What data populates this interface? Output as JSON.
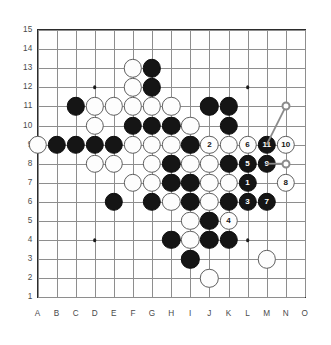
{
  "board": {
    "type": "go-board",
    "size": 15,
    "col_labels": [
      "A",
      "B",
      "C",
      "D",
      "E",
      "F",
      "G",
      "H",
      "I",
      "J",
      "K",
      "L",
      "M",
      "N",
      "O"
    ],
    "row_labels": [
      "15",
      "14",
      "13",
      "12",
      "11",
      "10",
      "9",
      "8",
      "7",
      "6",
      "5",
      "4",
      "3",
      "2",
      "1"
    ],
    "colors": {
      "background": "#ffffff",
      "grid_line": "#8e8e8e",
      "border": "#2b2b2b",
      "black_stone": "#151515",
      "white_stone": "#fdfdfd",
      "white_stone_edge": "#5f5f5f",
      "label": "#4a4a4a",
      "marker": "#8b8b8b"
    },
    "geometry": {
      "origin_x": 37.5,
      "origin_y": 30.0,
      "step": 19.1,
      "stone_diameter": 18.4
    },
    "hoshi": [
      {
        "col": "D",
        "row": 12
      },
      {
        "col": "L",
        "row": 12
      },
      {
        "col": "D",
        "row": 4
      },
      {
        "col": "L",
        "row": 4
      }
    ],
    "black_stones": [
      {
        "col": "G",
        "row": 13
      },
      {
        "col": "G",
        "row": 12
      },
      {
        "col": "C",
        "row": 11
      },
      {
        "col": "J",
        "row": 11
      },
      {
        "col": "K",
        "row": 11
      },
      {
        "col": "F",
        "row": 10
      },
      {
        "col": "G",
        "row": 10
      },
      {
        "col": "H",
        "row": 10
      },
      {
        "col": "K",
        "row": 10
      },
      {
        "col": "B",
        "row": 9
      },
      {
        "col": "C",
        "row": 9
      },
      {
        "col": "D",
        "row": 9
      },
      {
        "col": "E",
        "row": 9
      },
      {
        "col": "I",
        "row": 9
      },
      {
        "col": "H",
        "row": 8
      },
      {
        "col": "K",
        "row": 8
      },
      {
        "col": "H",
        "row": 7
      },
      {
        "col": "I",
        "row": 7
      },
      {
        "col": "E",
        "row": 6
      },
      {
        "col": "G",
        "row": 6
      },
      {
        "col": "I",
        "row": 6
      },
      {
        "col": "K",
        "row": 6
      },
      {
        "col": "J",
        "row": 5
      },
      {
        "col": "H",
        "row": 4
      },
      {
        "col": "J",
        "row": 4
      },
      {
        "col": "K",
        "row": 4
      },
      {
        "col": "I",
        "row": 3
      }
    ],
    "white_stones": [
      {
        "col": "F",
        "row": 13
      },
      {
        "col": "F",
        "row": 12
      },
      {
        "col": "D",
        "row": 11
      },
      {
        "col": "E",
        "row": 11
      },
      {
        "col": "F",
        "row": 11
      },
      {
        "col": "G",
        "row": 11
      },
      {
        "col": "H",
        "row": 11
      },
      {
        "col": "D",
        "row": 10
      },
      {
        "col": "I",
        "row": 10
      },
      {
        "col": "A",
        "row": 9
      },
      {
        "col": "F",
        "row": 9
      },
      {
        "col": "G",
        "row": 9
      },
      {
        "col": "H",
        "row": 9
      },
      {
        "col": "K",
        "row": 9
      },
      {
        "col": "D",
        "row": 8
      },
      {
        "col": "E",
        "row": 8
      },
      {
        "col": "G",
        "row": 8
      },
      {
        "col": "I",
        "row": 8
      },
      {
        "col": "J",
        "row": 8
      },
      {
        "col": "F",
        "row": 7
      },
      {
        "col": "G",
        "row": 7
      },
      {
        "col": "J",
        "row": 7
      },
      {
        "col": "K",
        "row": 7
      },
      {
        "col": "H",
        "row": 6
      },
      {
        "col": "J",
        "row": 6
      },
      {
        "col": "I",
        "row": 5
      },
      {
        "col": "I",
        "row": 4
      },
      {
        "col": "M",
        "row": 3
      },
      {
        "col": "J",
        "row": 2
      }
    ],
    "numbered_moves": [
      {
        "n": "1",
        "col": "L",
        "row": 7,
        "color": "black"
      },
      {
        "n": "2",
        "col": "J",
        "row": 9,
        "color": "white"
      },
      {
        "n": "3",
        "col": "L",
        "row": 6,
        "color": "black"
      },
      {
        "n": "4",
        "col": "K",
        "row": 5,
        "color": "white"
      },
      {
        "n": "5",
        "col": "L",
        "row": 8,
        "color": "black"
      },
      {
        "n": "6",
        "col": "L",
        "row": 9,
        "color": "white"
      },
      {
        "n": "7",
        "col": "M",
        "row": 6,
        "color": "black"
      },
      {
        "n": "8",
        "col": "N",
        "row": 7,
        "color": "white"
      },
      {
        "n": "9",
        "col": "M",
        "row": 8,
        "color": "black"
      },
      {
        "n": "10",
        "col": "N",
        "row": 9,
        "color": "white"
      },
      {
        "n": "11",
        "col": "M",
        "row": 9,
        "color": "black"
      }
    ],
    "markers": [
      {
        "id": "marker-a",
        "col": "N",
        "row": 11,
        "shape": "circle"
      },
      {
        "id": "marker-b",
        "col": "N",
        "row": 8,
        "shape": "circle"
      }
    ],
    "connectors": [
      {
        "from": {
          "col": "N",
          "row": 11
        },
        "to": {
          "col": "M",
          "row": 9
        }
      },
      {
        "from": {
          "col": "M",
          "row": 8
        },
        "to": {
          "col": "N",
          "row": 8
        }
      }
    ]
  }
}
